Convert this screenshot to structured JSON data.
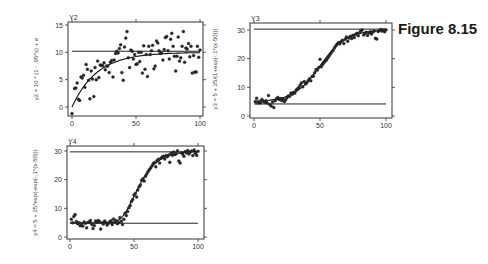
{
  "figure": {
    "title": "Figure 8.15"
  },
  "chart_data": [
    {
      "type": "scatter",
      "panel": "Y2",
      "title": "Y2",
      "ylabel": "y2 = 10 * (1 - .95^x) + e",
      "ylabel_right": "y3 = 5 + 25/(1+exp(-.1*(x-50)))",
      "xlabel": "",
      "xlim": [
        0,
        100
      ],
      "ylim": [
        -1.5,
        15.5
      ],
      "x_ticks": [
        0,
        50,
        100
      ],
      "y_ticks": [
        0,
        5,
        10,
        15
      ],
      "frame": {
        "left": 68,
        "right": 203,
        "top": 22,
        "bottom": 116,
        "x0": 72,
        "x100": 200,
        "yvalLo": 0,
        "yLo": 107,
        "yvalHi": 15,
        "yHi": 25
      },
      "hlines": [
        {
          "y": 10.2,
          "x_from": 0,
          "x_to": 100
        }
      ],
      "curve": {
        "kind": "exp_saturation",
        "formula": "10*(1-0.95^x)",
        "x_from": 0,
        "x_to": 100
      },
      "points": [
        [
          0,
          -1.2
        ],
        [
          2,
          3.4
        ],
        [
          3,
          3.5
        ],
        [
          4,
          4.4
        ],
        [
          5,
          1.4
        ],
        [
          6,
          1.2
        ],
        [
          7,
          5.5
        ],
        [
          8,
          5.3
        ],
        [
          9,
          5.8
        ],
        [
          10,
          3.6
        ],
        [
          11,
          7.8
        ],
        [
          12,
          6.9
        ],
        [
          13,
          4.9
        ],
        [
          14,
          1.5
        ],
        [
          15,
          6.6
        ],
        [
          16,
          5.1
        ],
        [
          17,
          1.9
        ],
        [
          18,
          7.2
        ],
        [
          19,
          5.0
        ],
        [
          20,
          8.4
        ],
        [
          21,
          5.4
        ],
        [
          22,
          7.7
        ],
        [
          23,
          7.6
        ],
        [
          24,
          7.6
        ],
        [
          25,
          8.1
        ],
        [
          26,
          6.8
        ],
        [
          27,
          7.5
        ],
        [
          28,
          7.5
        ],
        [
          29,
          6.3
        ],
        [
          30,
          8.2
        ],
        [
          31,
          8.5
        ],
        [
          32,
          5.5
        ],
        [
          33,
          8.6
        ],
        [
          34,
          9.8
        ],
        [
          35,
          10.2
        ],
        [
          36,
          9.9
        ],
        [
          37,
          10.7
        ],
        [
          38,
          11.4
        ],
        [
          39,
          6.3
        ],
        [
          40,
          4.9
        ],
        [
          41,
          11.0
        ],
        [
          42,
          12.6
        ],
        [
          43,
          13.8
        ],
        [
          44,
          9.0
        ],
        [
          45,
          7.2
        ],
        [
          46,
          10.4
        ],
        [
          47,
          10.2
        ],
        [
          48,
          8.8
        ],
        [
          49,
          9.6
        ],
        [
          50,
          7.8
        ],
        [
          51,
          7.9
        ],
        [
          52,
          10.0
        ],
        [
          53,
          8.3
        ],
        [
          54,
          10.0
        ],
        [
          55,
          6.2
        ],
        [
          56,
          11.2
        ],
        [
          57,
          6.9
        ],
        [
          58,
          9.6
        ],
        [
          59,
          5.6
        ],
        [
          60,
          11.1
        ],
        [
          61,
          9.6
        ],
        [
          62,
          10.3
        ],
        [
          63,
          11.3
        ],
        [
          64,
          7.0
        ],
        [
          65,
          7.5
        ],
        [
          66,
          12.1
        ],
        [
          67,
          11.7
        ],
        [
          68,
          10.3
        ],
        [
          69,
          9.8
        ],
        [
          70,
          9.9
        ],
        [
          71,
          8.6
        ],
        [
          72,
          10.5
        ],
        [
          73,
          12.7
        ],
        [
          74,
          12.9
        ],
        [
          75,
          10.3
        ],
        [
          76,
          8.8
        ],
        [
          77,
          12.4
        ],
        [
          78,
          13.5
        ],
        [
          79,
          11.1
        ],
        [
          80,
          9.3
        ],
        [
          81,
          6.6
        ],
        [
          82,
          9.3
        ],
        [
          83,
          12.8
        ],
        [
          84,
          8.4
        ],
        [
          85,
          9.0
        ],
        [
          86,
          11.1
        ],
        [
          87,
          13.8
        ],
        [
          88,
          8.2
        ],
        [
          89,
          10.8
        ],
        [
          90,
          10.6
        ],
        [
          91,
          11.6
        ],
        [
          92,
          9.2
        ],
        [
          93,
          11.1
        ],
        [
          94,
          6.2
        ],
        [
          95,
          9.4
        ],
        [
          96,
          6.4
        ],
        [
          97,
          6.4
        ],
        [
          98,
          11.1
        ],
        [
          99,
          9.1
        ],
        [
          100,
          10.4
        ]
      ]
    },
    {
      "type": "scatter",
      "panel": "Y3",
      "title": "Y3",
      "ylabel": "",
      "xlabel": "",
      "xlim": [
        0,
        100
      ],
      "ylim": [
        -1,
        31.5
      ],
      "x_ticks": [
        0,
        50,
        100
      ],
      "y_ticks": [
        0,
        10,
        20,
        30
      ],
      "frame": {
        "left": 250,
        "right": 392,
        "top": 23,
        "bottom": 118,
        "x0": 254,
        "x100": 386,
        "yvalLo": 0,
        "yLo": 116,
        "yvalHi": 30,
        "yHi": 30
      },
      "hlines": [
        {
          "y": 30.3,
          "x_from": 0,
          "x_to": 100
        },
        {
          "y": 4.2,
          "x_from": 0,
          "x_to": 100
        }
      ],
      "curve": {
        "kind": "logistic_smooth",
        "formula": "5+25/(1+exp(-0.1*(x-50)))",
        "x_from": 0,
        "x_to": 100
      },
      "points": [
        [
          1,
          5.0
        ],
        [
          2,
          6.2
        ],
        [
          3,
          4.5
        ],
        [
          4,
          5.0
        ],
        [
          5,
          4.6
        ],
        [
          6,
          5.8
        ],
        [
          7,
          5.2
        ],
        [
          8,
          4.8
        ],
        [
          9,
          5.3
        ],
        [
          10,
          4.5
        ],
        [
          11,
          7.2
        ],
        [
          12,
          4.0
        ],
        [
          13,
          3.5
        ],
        [
          14,
          4.9
        ],
        [
          15,
          3.0
        ],
        [
          16,
          5.3
        ],
        [
          17,
          6.0
        ],
        [
          18,
          6.5
        ],
        [
          19,
          5.8
        ],
        [
          20,
          6.1
        ],
        [
          21,
          5.4
        ],
        [
          22,
          6.0
        ],
        [
          23,
          5.1
        ],
        [
          24,
          5.7
        ],
        [
          25,
          6.5
        ],
        [
          26,
          7.0
        ],
        [
          27,
          6.9
        ],
        [
          28,
          8.0
        ],
        [
          29,
          7.6
        ],
        [
          30,
          8.3
        ],
        [
          31,
          8.0
        ],
        [
          32,
          9.1
        ],
        [
          33,
          9.5
        ],
        [
          34,
          10.0
        ],
        [
          35,
          10.8
        ],
        [
          36,
          11.6
        ],
        [
          37,
          10.2
        ],
        [
          38,
          12.0
        ],
        [
          39,
          11.2
        ],
        [
          40,
          11.6
        ],
        [
          41,
          12.3
        ],
        [
          42,
          13.0
        ],
        [
          43,
          12.3
        ],
        [
          44,
          13.8
        ],
        [
          45,
          14.0
        ],
        [
          46,
          15.1
        ],
        [
          47,
          16.2
        ],
        [
          48,
          16.0
        ],
        [
          49,
          16.9
        ],
        [
          50,
          19.8
        ],
        [
          51,
          17.2
        ],
        [
          52,
          18.0
        ],
        [
          53,
          18.7
        ],
        [
          54,
          19.2
        ],
        [
          55,
          19.6
        ],
        [
          56,
          20.3
        ],
        [
          57,
          21.0
        ],
        [
          58,
          21.7
        ],
        [
          59,
          22.4
        ],
        [
          60,
          23.0
        ],
        [
          61,
          23.8
        ],
        [
          62,
          24.5
        ],
        [
          63,
          25.1
        ],
        [
          64,
          25.6
        ],
        [
          65,
          25.2
        ],
        [
          66,
          26.0
        ],
        [
          67,
          26.4
        ],
        [
          68,
          25.3
        ],
        [
          69,
          26.8
        ],
        [
          70,
          27.6
        ],
        [
          71,
          26.1
        ],
        [
          72,
          27.2
        ],
        [
          73,
          27.8
        ],
        [
          74,
          27.0
        ],
        [
          75,
          28.2
        ],
        [
          76,
          27.4
        ],
        [
          77,
          28.5
        ],
        [
          78,
          28.9
        ],
        [
          79,
          28.0
        ],
        [
          80,
          29.1
        ],
        [
          81,
          29.8
        ],
        [
          82,
          30.0
        ],
        [
          83,
          28.3
        ],
        [
          84,
          28.8
        ],
        [
          85,
          29.2
        ],
        [
          86,
          28.1
        ],
        [
          87,
          29.0
        ],
        [
          88,
          29.4
        ],
        [
          89,
          28.6
        ],
        [
          90,
          29.3
        ],
        [
          91,
          29.7
        ],
        [
          92,
          27.1
        ],
        [
          93,
          26.9
        ],
        [
          94,
          29.5
        ],
        [
          95,
          29.8
        ],
        [
          96,
          30.2
        ],
        [
          97,
          29.6
        ],
        [
          98,
          30.0
        ],
        [
          99,
          29.4
        ],
        [
          100,
          30.1
        ]
      ]
    },
    {
      "type": "scatter",
      "panel": "Y4",
      "title": "Y4",
      "ylabel": "y4 = 5 + 25*exp(-exp(-.1*(x-50)))",
      "xlabel": "",
      "xlim": [
        0,
        100
      ],
      "ylim": [
        -1,
        31.5
      ],
      "x_ticks": [
        0,
        50,
        100
      ],
      "y_ticks": [
        0,
        10,
        20,
        30
      ],
      "frame": {
        "left": 67,
        "right": 204,
        "top": 146,
        "bottom": 239,
        "x0": 70,
        "x100": 198,
        "yvalLo": 0,
        "yLo": 237,
        "yvalHi": 30,
        "yHi": 151
      },
      "hlines": [
        {
          "y": 29.7,
          "x_from": 0,
          "x_to": 100
        },
        {
          "y": 4.8,
          "x_from": 0,
          "x_to": 100
        }
      ],
      "curve": {
        "kind": "gompertz_smooth",
        "formula": "5+25*exp(-exp(-0.1*(x-50)))",
        "x_from": 0,
        "x_to": 100
      },
      "points": [
        [
          1,
          6.2
        ],
        [
          2,
          5.0
        ],
        [
          3,
          7.2
        ],
        [
          4,
          7.8
        ],
        [
          5,
          5.4
        ],
        [
          6,
          4.6
        ],
        [
          7,
          5.0
        ],
        [
          8,
          3.9
        ],
        [
          9,
          4.2
        ],
        [
          10,
          3.8
        ],
        [
          11,
          5.2
        ],
        [
          12,
          4.8
        ],
        [
          13,
          3.2
        ],
        [
          14,
          5.1
        ],
        [
          15,
          5.3
        ],
        [
          16,
          5.8
        ],
        [
          17,
          4.4
        ],
        [
          18,
          3.0
        ],
        [
          19,
          4.0
        ],
        [
          20,
          5.6
        ],
        [
          21,
          5.2
        ],
        [
          22,
          5.8
        ],
        [
          23,
          5.4
        ],
        [
          24,
          2.8
        ],
        [
          25,
          5.0
        ],
        [
          26,
          4.5
        ],
        [
          27,
          5.6
        ],
        [
          28,
          5.1
        ],
        [
          29,
          4.2
        ],
        [
          30,
          4.8
        ],
        [
          31,
          5.3
        ],
        [
          32,
          5.7
        ],
        [
          33,
          4.4
        ],
        [
          34,
          6.3
        ],
        [
          35,
          5.2
        ],
        [
          36,
          5.8
        ],
        [
          37,
          4.6
        ],
        [
          38,
          5.1
        ],
        [
          39,
          6.8
        ],
        [
          40,
          5.5
        ],
        [
          41,
          4.4
        ],
        [
          42,
          6.2
        ],
        [
          43,
          8.3
        ],
        [
          44,
          7.5
        ],
        [
          45,
          8.9
        ],
        [
          46,
          10.2
        ],
        [
          47,
          11.0
        ],
        [
          48,
          12.4
        ],
        [
          49,
          13.1
        ],
        [
          50,
          14.6
        ],
        [
          51,
          15.2
        ],
        [
          52,
          14.0
        ],
        [
          53,
          16.4
        ],
        [
          54,
          17.5
        ],
        [
          55,
          18.1
        ],
        [
          56,
          19.8
        ],
        [
          57,
          20.3
        ],
        [
          58,
          19.5
        ],
        [
          59,
          21.2
        ],
        [
          60,
          22.0
        ],
        [
          61,
          22.8
        ],
        [
          62,
          23.5
        ],
        [
          63,
          24.1
        ],
        [
          64,
          24.8
        ],
        [
          65,
          25.6
        ],
        [
          66,
          26.0
        ],
        [
          67,
          24.5
        ],
        [
          68,
          26.6
        ],
        [
          69,
          27.1
        ],
        [
          70,
          25.8
        ],
        [
          71,
          27.5
        ],
        [
          72,
          27.9
        ],
        [
          73,
          28.2
        ],
        [
          74,
          27.2
        ],
        [
          75,
          28.4
        ],
        [
          76,
          28.0
        ],
        [
          77,
          28.6
        ],
        [
          78,
          26.1
        ],
        [
          79,
          29.2
        ],
        [
          80,
          28.5
        ],
        [
          81,
          29.6
        ],
        [
          82,
          28.8
        ],
        [
          83,
          29.1
        ],
        [
          84,
          30.1
        ],
        [
          85,
          26.5
        ],
        [
          86,
          25.8
        ],
        [
          87,
          29.4
        ],
        [
          88,
          29.0
        ],
        [
          89,
          28.2
        ],
        [
          90,
          29.8
        ],
        [
          91,
          29.3
        ],
        [
          92,
          30.2
        ],
        [
          93,
          29.0
        ],
        [
          94,
          29.6
        ],
        [
          95,
          30.0
        ],
        [
          96,
          28.4
        ],
        [
          97,
          30.4
        ],
        [
          98,
          29.2
        ],
        [
          99,
          28.5
        ],
        [
          100,
          29.9
        ]
      ]
    }
  ]
}
